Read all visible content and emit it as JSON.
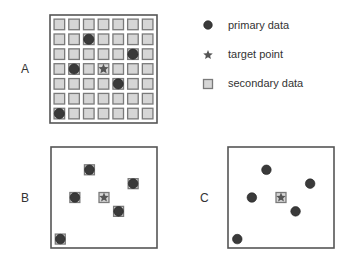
{
  "panels": [
    {
      "label": "A",
      "mode": "grid"
    },
    {
      "label": "B",
      "mode": "overlap"
    },
    {
      "label": "C",
      "mode": "primary-only"
    }
  ],
  "grid": {
    "rows": 7,
    "cols": 7
  },
  "primary_points": [
    {
      "row": 1,
      "col": 2
    },
    {
      "row": 2,
      "col": 5
    },
    {
      "row": 3,
      "col": 1
    },
    {
      "row": 4,
      "col": 4
    },
    {
      "row": 6,
      "col": 0
    }
  ],
  "target_point": {
    "row": 3,
    "col": 3
  },
  "legend": [
    {
      "icon": "circle-icon",
      "label": "primary data"
    },
    {
      "icon": "star-icon",
      "label": "target point"
    },
    {
      "icon": "square-icon",
      "label": "secondary data"
    }
  ],
  "colors": {
    "primary": "#3a3a3a",
    "secondary_fill": "#d6d6d6",
    "secondary_stroke": "#7a7a7a",
    "frame": "#555555"
  }
}
